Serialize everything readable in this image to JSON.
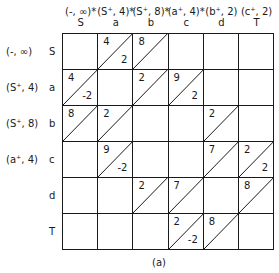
{
  "columns": [
    {
      "label": "(-, ∞)*",
      "node": "S"
    },
    {
      "label": "(S⁺, 4)*",
      "node": "a"
    },
    {
      "label": "(S⁺, 8)*",
      "node": "b"
    },
    {
      "label": "(a⁺, 4)*",
      "node": "c"
    },
    {
      "label": "(b⁺, 2)",
      "node": "d"
    },
    {
      "label": "(c⁺, 2)",
      "node": "T"
    }
  ],
  "rows": [
    {
      "label": "(-, ∞)",
      "node": "S"
    },
    {
      "label": "(S⁺, 4)",
      "node": "a"
    },
    {
      "label": "(S⁺, 8)",
      "node": "b"
    },
    {
      "label": "(a⁺, 4)",
      "node": "c"
    },
    {
      "label": "",
      "node": "d"
    },
    {
      "label": "",
      "node": "T"
    }
  ],
  "cells": [
    {
      "r": 0,
      "c": 1,
      "top": "4",
      "bottom": "2",
      "diag": true
    },
    {
      "r": 0,
      "c": 2,
      "top": "8",
      "bottom": "",
      "diag": true
    },
    {
      "r": 1,
      "c": 0,
      "top": "4",
      "bottom": "-2",
      "diag": true
    },
    {
      "r": 1,
      "c": 2,
      "top": "2",
      "bottom": "",
      "diag": true
    },
    {
      "r": 1,
      "c": 3,
      "top": "9",
      "bottom": "2",
      "diag": true
    },
    {
      "r": 2,
      "c": 0,
      "top": "8",
      "bottom": "",
      "diag": true
    },
    {
      "r": 2,
      "c": 1,
      "top": "2",
      "bottom": "",
      "diag": true
    },
    {
      "r": 2,
      "c": 4,
      "top": "2",
      "bottom": "",
      "diag": true
    },
    {
      "r": 3,
      "c": 1,
      "top": "9",
      "bottom": "-2",
      "diag": true
    },
    {
      "r": 3,
      "c": 4,
      "top": "7",
      "bottom": "",
      "diag": true
    },
    {
      "r": 3,
      "c": 5,
      "top": "2",
      "bottom": "2",
      "diag": true
    },
    {
      "r": 4,
      "c": 2,
      "top": "2",
      "bottom": "",
      "diag": true
    },
    {
      "r": 4,
      "c": 3,
      "top": "7",
      "bottom": "",
      "diag": true
    },
    {
      "r": 4,
      "c": 5,
      "top": "8",
      "bottom": "",
      "diag": true
    },
    {
      "r": 5,
      "c": 3,
      "top": "2",
      "bottom": "-2",
      "diag": true
    },
    {
      "r": 5,
      "c": 4,
      "top": "8",
      "bottom": "",
      "diag": true
    }
  ],
  "caption": "(a)"
}
